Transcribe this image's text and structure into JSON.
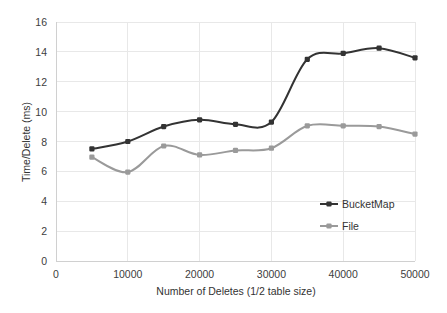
{
  "chart_data": {
    "type": "line",
    "title": "",
    "xlabel": "Number of Deletes (1/2 table size)",
    "ylabel": "Time/Delete (ms)",
    "xlim": [
      0,
      50000
    ],
    "ylim": [
      0,
      16
    ],
    "x": [
      5000,
      10000,
      15000,
      20000,
      25000,
      30000,
      35000,
      40000,
      45000,
      50000
    ],
    "xticks": [
      "0",
      "10000",
      "20000",
      "30000",
      "40000",
      "50000"
    ],
    "xtick_values": [
      0,
      10000,
      20000,
      30000,
      40000,
      50000
    ],
    "yticks": [
      "0",
      "2",
      "4",
      "6",
      "8",
      "10",
      "12",
      "14",
      "16"
    ],
    "ytick_values": [
      0,
      2,
      4,
      6,
      8,
      10,
      12,
      14,
      16
    ],
    "grid": true,
    "legend_position": "inside-lower-right",
    "smoothing": "spline",
    "series": [
      {
        "name": "BucketMap",
        "color": "#333333",
        "marker": "square",
        "values": [
          7.5,
          8.0,
          9.0,
          9.45,
          9.15,
          9.3,
          13.5,
          13.9,
          14.25,
          13.6
        ]
      },
      {
        "name": "File",
        "color": "#9a9a9a",
        "marker": "square",
        "values": [
          6.95,
          5.95,
          7.7,
          7.1,
          7.4,
          7.55,
          9.05,
          9.05,
          9.0,
          8.5
        ]
      }
    ]
  },
  "legend": {
    "items": [
      {
        "label": "BucketMap",
        "color": "#333333"
      },
      {
        "label": "File",
        "color": "#9a9a9a"
      }
    ]
  }
}
